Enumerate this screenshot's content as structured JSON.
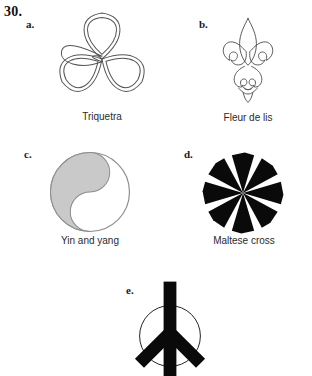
{
  "page": {
    "question_number": "30.",
    "background_color": "#ffffff",
    "width": 312,
    "height": 363
  },
  "items": [
    {
      "letter": "a.",
      "caption": "Triquetra",
      "icon": "triquetra-icon",
      "style": "outline",
      "stroke_color": "#555555",
      "fill_color": "none"
    },
    {
      "letter": "b.",
      "caption": "Fleur de lis",
      "icon": "fleur-de-lis-icon",
      "style": "outline",
      "stroke_color": "#555555",
      "fill_color": "none"
    },
    {
      "letter": "c.",
      "caption": "Yin and yang",
      "icon": "yin-yang-icon",
      "style": "filled-half",
      "stroke_color": "#808080",
      "fill_color": "#c9c9c9"
    },
    {
      "letter": "d.",
      "caption": "Maltese cross",
      "icon": "maltese-cross-icon",
      "style": "solid",
      "stroke_color": "#000000",
      "fill_color": "#000000"
    },
    {
      "letter": "e.",
      "caption": "",
      "icon": "peace-sign-icon",
      "style": "solid-with-circle",
      "stroke_color": "#000000",
      "fill_color": "#000000"
    }
  ]
}
